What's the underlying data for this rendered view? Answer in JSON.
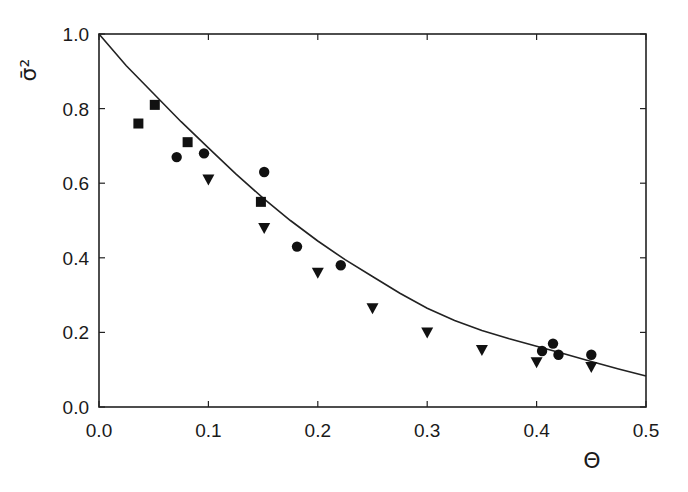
{
  "chart_data": {
    "type": "scatter",
    "title": "",
    "xlabel": "Θ",
    "ylabel": "σ̄²",
    "xlim": [
      0.0,
      0.5
    ],
    "ylim": [
      0.0,
      1.0
    ],
    "xticks": [
      "0.0",
      "0.1",
      "0.2",
      "0.3",
      "0.4",
      "0.5"
    ],
    "yticks": [
      "0.0",
      "0.2",
      "0.4",
      "0.6",
      "0.8",
      "1.0"
    ],
    "grid": false,
    "legend": null,
    "series": [
      {
        "name": "squares",
        "marker": "square",
        "points": [
          [
            0.036,
            0.76
          ],
          [
            0.051,
            0.81
          ],
          [
            0.081,
            0.71
          ],
          [
            0.148,
            0.55
          ]
        ]
      },
      {
        "name": "circles",
        "marker": "circle",
        "points": [
          [
            0.071,
            0.67
          ],
          [
            0.096,
            0.68
          ],
          [
            0.151,
            0.63
          ],
          [
            0.181,
            0.43
          ],
          [
            0.221,
            0.38
          ],
          [
            0.405,
            0.15
          ],
          [
            0.415,
            0.17
          ],
          [
            0.42,
            0.14
          ],
          [
            0.45,
            0.14
          ]
        ]
      },
      {
        "name": "triangles",
        "marker": "triangle-down",
        "points": [
          [
            0.1,
            0.61
          ],
          [
            0.151,
            0.48
          ],
          [
            0.2,
            0.36
          ],
          [
            0.25,
            0.265
          ],
          [
            0.3,
            0.2
          ],
          [
            0.35,
            0.153
          ],
          [
            0.4,
            0.12
          ],
          [
            0.45,
            0.107
          ]
        ]
      },
      {
        "name": "fit-curve",
        "marker": "line",
        "points": [
          [
            0.0,
            1.0
          ],
          [
            0.025,
            0.915
          ],
          [
            0.05,
            0.84
          ],
          [
            0.075,
            0.765
          ],
          [
            0.1,
            0.695
          ],
          [
            0.125,
            0.625
          ],
          [
            0.15,
            0.56
          ],
          [
            0.175,
            0.5
          ],
          [
            0.2,
            0.445
          ],
          [
            0.225,
            0.395
          ],
          [
            0.25,
            0.35
          ],
          [
            0.275,
            0.305
          ],
          [
            0.3,
            0.265
          ],
          [
            0.325,
            0.232
          ],
          [
            0.35,
            0.205
          ],
          [
            0.375,
            0.183
          ],
          [
            0.4,
            0.163
          ],
          [
            0.425,
            0.143
          ],
          [
            0.45,
            0.122
          ],
          [
            0.475,
            0.102
          ],
          [
            0.5,
            0.083
          ]
        ]
      }
    ]
  }
}
